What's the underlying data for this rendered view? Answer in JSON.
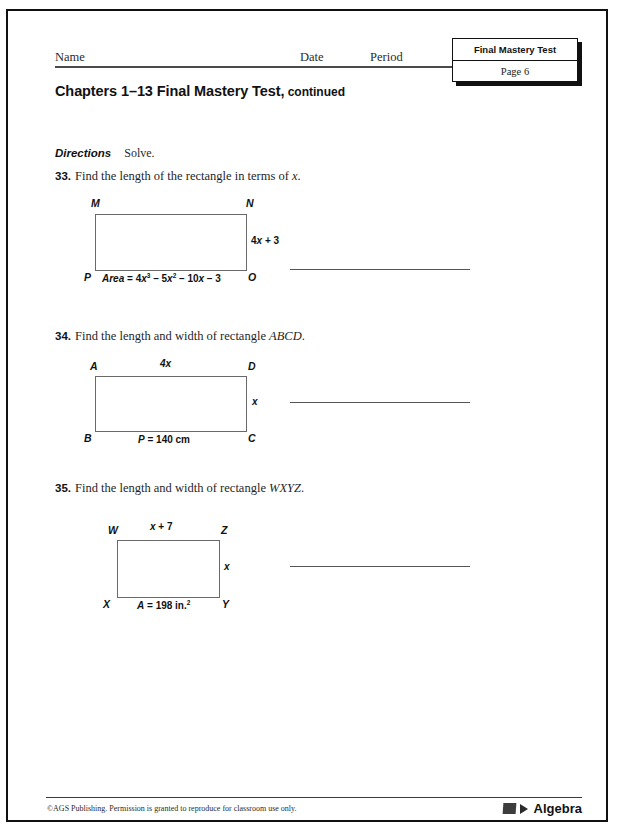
{
  "header": {
    "name_label": "Name",
    "date_label": "Date",
    "period_label": "Period",
    "corner_title": "Final Mastery Test",
    "corner_page": "Page 6"
  },
  "title": {
    "main": "Chapters 1–13 Final Mastery Test,",
    "continued": " continued"
  },
  "directions": {
    "label": "Directions",
    "text": "Solve."
  },
  "problems": [
    {
      "number": "33.",
      "stem_before": "Find the length of the rectangle in terms of ",
      "stem_italic": "x",
      "stem_after": ".",
      "figure": {
        "vertices": {
          "top_left": "M",
          "top_right": "N",
          "bottom_left": "P",
          "bottom_right": "O"
        },
        "height_label": "4x + 3",
        "height_var": "x",
        "area_label": "Area = 4x³ – 5x² – 10x – 3"
      }
    },
    {
      "number": "34.",
      "stem_before": "Find the length and width of rectangle ",
      "stem_italic": "ABCD",
      "stem_after": ".",
      "figure": {
        "vertices": {
          "top_left": "A",
          "top_right": "D",
          "bottom_left": "B",
          "bottom_right": "C"
        },
        "top_label": "4x",
        "side_label": "x",
        "bottom_label": "P = 140 cm"
      }
    },
    {
      "number": "35.",
      "stem_before": "Find the length and width of rectangle ",
      "stem_italic": "WXYZ",
      "stem_after": ".",
      "figure": {
        "vertices": {
          "top_left": "W",
          "top_right": "Z",
          "bottom_left": "X",
          "bottom_right": "Y"
        },
        "top_label": "x + 7",
        "side_label": "x",
        "area_label": "A = 198 in.",
        "area_exponent": "2"
      }
    }
  ],
  "footer": {
    "copyright": "©AGS Publishing. Permission is granted to reproduce for classroom use only.",
    "brand": "Algebra"
  }
}
